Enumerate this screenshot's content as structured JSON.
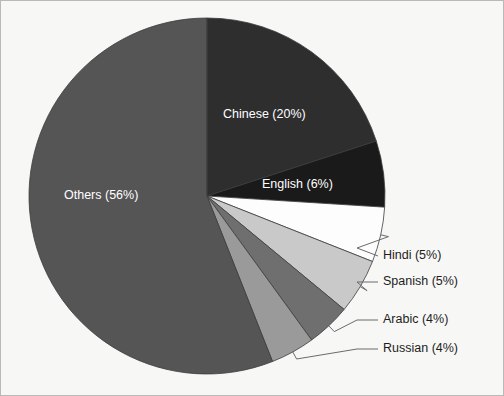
{
  "chart_data": {
    "type": "pie",
    "title": "",
    "subtitle": "",
    "xlabel": "",
    "ylabel": "",
    "legend_position": "none",
    "grid": false,
    "unit": "%",
    "total": 100,
    "start_angle_deg": 0,
    "direction": "clockwise",
    "categories": [
      "Chinese",
      "English",
      "Hindi",
      "Spanish",
      "Arabic",
      "Russian",
      "Others"
    ],
    "values": [
      20,
      6,
      5,
      5,
      4,
      4,
      56
    ],
    "slices": [
      {
        "name": "Chinese",
        "value": 20,
        "label": "Chinese (20%)",
        "color": "#2e2e2e",
        "label_placement": "inside",
        "label_color": "#ffffff"
      },
      {
        "name": "English",
        "value": 6,
        "label": "English (6%)",
        "color": "#1a1a1a",
        "label_placement": "inside",
        "label_color": "#ffffff"
      },
      {
        "name": "Hindi",
        "value": 5,
        "label": "Hindi (5%)",
        "color": "#fdfdfd",
        "label_placement": "outside",
        "label_color": "#1d1d1d"
      },
      {
        "name": "Spanish",
        "value": 5,
        "label": "Spanish (5%)",
        "color": "#c9c9c9",
        "label_placement": "outside",
        "label_color": "#1d1d1d"
      },
      {
        "name": "Arabic",
        "value": 4,
        "label": "Arabic (4%)",
        "color": "#6f6f6f",
        "label_placement": "outside",
        "label_color": "#1d1d1d"
      },
      {
        "name": "Russian",
        "value": 4,
        "label": "Russian (4%)",
        "color": "#9a9a9a",
        "label_placement": "outside",
        "label_color": "#1d1d1d"
      },
      {
        "name": "Others",
        "value": 56,
        "label": "Others (56%)",
        "color": "#555555",
        "label_placement": "inside",
        "label_color": "#ffffff"
      }
    ]
  },
  "labels": {
    "chinese": "Chinese (20%)",
    "english": "English (6%)",
    "hindi": "Hindi (5%)",
    "spanish": "Spanish (5%)",
    "arabic": "Arabic (4%)",
    "russian": "Russian (4%)",
    "others": "Others (56%)"
  },
  "colors": {
    "background": "#f7f7f5",
    "border": "#b9b9b7",
    "slice_outline": "#3c3c3c",
    "leader_line": "#6b6b6b",
    "inside_text": "#ffffff",
    "outside_text": "#1d1d1d"
  }
}
